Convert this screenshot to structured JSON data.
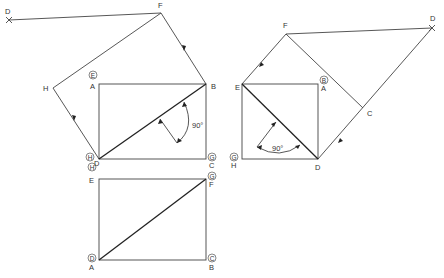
{
  "diagram": {
    "type": "geometric construction - rectangle rotations",
    "left_top": {
      "points": {
        "D": "D",
        "F": "F",
        "H": "H",
        "A": "A",
        "B": "B",
        "C": "C",
        "Dcorner": "D"
      },
      "circled": {
        "A_top": "E",
        "D_left": "H",
        "C_right": "G"
      },
      "angle_label": "90°"
    },
    "left_bottom": {
      "corners": {
        "tl": "E",
        "tr": "F",
        "bl": "A",
        "br": "B"
      },
      "circled": {
        "tl": "H",
        "tr": "G",
        "bl": "D",
        "br": "C"
      }
    },
    "right": {
      "points": {
        "F": "F",
        "D": "D",
        "E": "E",
        "A": "A",
        "C": "C",
        "Dcorner": "D",
        "H": "H"
      },
      "circled": {
        "A_top": "B",
        "H_left": "G"
      },
      "angle_label": "90°"
    }
  }
}
